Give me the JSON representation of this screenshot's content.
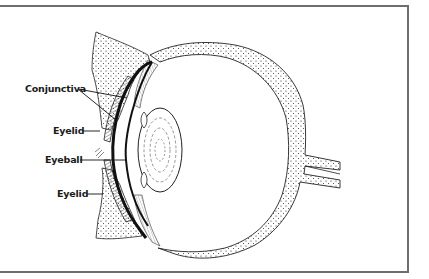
{
  "figure": {
    "labels": [
      {
        "id": "conjunctiva",
        "text": "Conjunctiva"
      },
      {
        "id": "eyelid-upper",
        "text": "Eyelid"
      },
      {
        "id": "eyeball",
        "text": "Eyeball"
      },
      {
        "id": "eyelid-lower",
        "text": "Eyelid"
      }
    ]
  },
  "colors": {
    "ink": "#1a1a1a",
    "frame": "#6e6e6e",
    "background": "#ffffff"
  }
}
